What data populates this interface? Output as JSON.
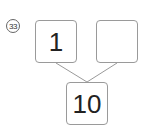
{
  "problem": {
    "number": "33",
    "number_glyph": "㉝",
    "boxes": {
      "top_left": "1",
      "top_right": "",
      "bottom": "10"
    },
    "colors": {
      "box_border": "#9a9a9a",
      "line": "#9a9a9a",
      "text": "#222222"
    }
  }
}
